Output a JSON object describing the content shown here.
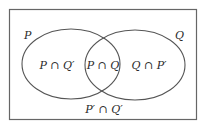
{
  "diagram": {
    "type": "venn",
    "sets": [
      {
        "name": "P",
        "label": "P"
      },
      {
        "name": "Q",
        "label": "Q"
      }
    ],
    "regions": {
      "p_only": "P ∩ Q′",
      "intersection": "P ∩ Q",
      "q_only": "Q ∩ P′",
      "outside": "P′ ∩ Q′"
    },
    "colors": {
      "stroke": "#555555",
      "text": "#2a2a2a",
      "background": "#ffffff"
    }
  }
}
